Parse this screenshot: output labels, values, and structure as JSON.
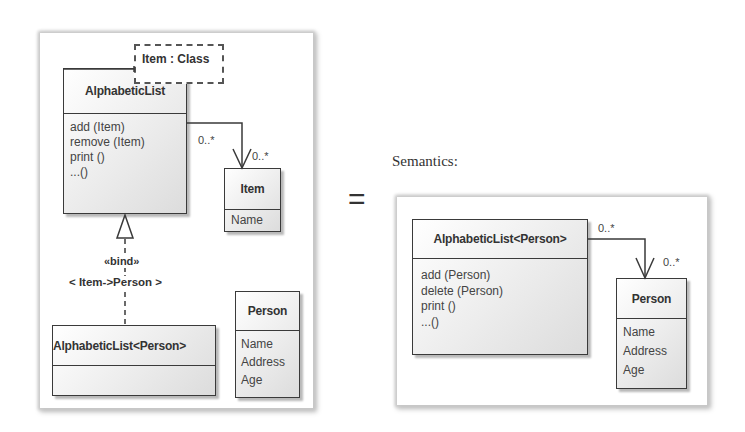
{
  "template_diagram": {
    "template_parameter": "Item : Class",
    "template_class": {
      "name": "AlphabeticList",
      "operations": [
        "add (Item)",
        "remove (Item)",
        "print ()",
        "...()"
      ]
    },
    "association": {
      "source_multiplicity": "0..*",
      "target_multiplicity": "0..*"
    },
    "item_class": {
      "name": "Item",
      "attributes": [
        "Name"
      ]
    },
    "binding": {
      "stereotype": "«bind»",
      "substitution": "< Item->Person >"
    },
    "bound_class": {
      "name": "AlphabeticList<Person>"
    },
    "person_class": {
      "name": "Person",
      "attributes": [
        "Name",
        "Address",
        "Age"
      ]
    }
  },
  "equals_sign": "=",
  "semantics": {
    "caption": "Semantics:",
    "bound_class": {
      "name": "AlphabeticList<Person>",
      "operations": [
        "add (Person)",
        "delete (Person)",
        "print ()",
        "...()"
      ]
    },
    "association": {
      "source_multiplicity": "0..*",
      "target_multiplicity": "0..*"
    },
    "person_class": {
      "name": "Person",
      "attributes": [
        "Name",
        "Address",
        "Age"
      ]
    }
  }
}
